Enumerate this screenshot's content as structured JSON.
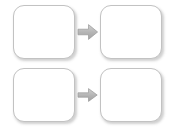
{
  "canvas": {
    "width": 178,
    "height": 131,
    "background_color": "#ffffff"
  },
  "style": {
    "box_border_color": "#c2c2c2",
    "box_fill_color": "#ffffff",
    "arrow_fill_color": "#b0b0b0",
    "arrow_edge_color": "#8f8f8f"
  },
  "diagram": {
    "type": "flow",
    "rows": [
      {
        "source": {
          "label": ""
        },
        "arrow": {
          "icon": "arrow-right-icon",
          "direction": "right",
          "label": ""
        },
        "target": {
          "label": ""
        }
      },
      {
        "source": {
          "label": ""
        },
        "arrow": {
          "icon": "arrow-right-icon",
          "direction": "right",
          "label": ""
        },
        "target": {
          "label": ""
        }
      }
    ]
  }
}
